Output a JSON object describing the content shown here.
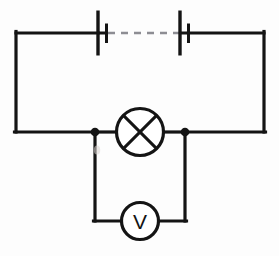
{
  "diagram": {
    "background_color": "#fdfdfd",
    "line_color": "#141414",
    "dashed_color": "#8d8d93",
    "components": [
      {
        "name": "cell-left",
        "type": "cell",
        "label": "",
        "long_plate_x": 98,
        "short_plate_x": 106.5
      },
      {
        "name": "cell-right",
        "type": "cell",
        "label": "",
        "long_plate_x": 180,
        "short_plate_x": 188.5
      },
      {
        "name": "lamp",
        "type": "lamp",
        "label": "",
        "cx": 140,
        "cy": 132,
        "r": 23.5
      },
      {
        "name": "voltmeter",
        "type": "voltmeter",
        "label": "V",
        "cx": 140,
        "cy": 221,
        "r": 18.5
      }
    ],
    "nodes": [
      {
        "name": "junction-left",
        "cx": 95,
        "cy": 132,
        "r": 4.3
      },
      {
        "name": "junction-right",
        "cx": 185,
        "cy": 132,
        "r": 4.3
      }
    ],
    "geometry": {
      "outer_top_y": 33,
      "outer_left_x": 16,
      "outer_right_x": 264,
      "middle_y": 132,
      "branch_left_x": 95,
      "branch_right_x": 185,
      "branch_bottom_y": 221
    },
    "dashed_link": {
      "name": "cells-continuation-dashes",
      "x1": 108,
      "x2": 179,
      "y": 33
    }
  },
  "voltmeter_symbol_text": "V"
}
